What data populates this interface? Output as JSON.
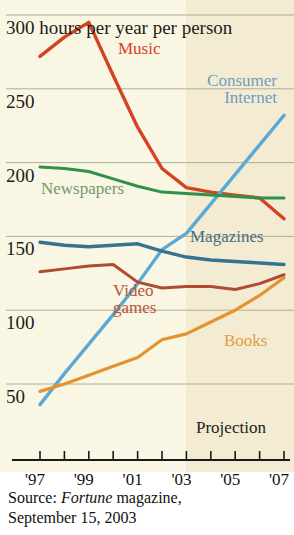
{
  "figure": {
    "background": "#faf6e4",
    "projection_band_color": "#f4ecd2",
    "axis_color": "#1c1c1c",
    "gridline_color": "#a9a78f"
  },
  "axis": {
    "y_top_label": "300 hours per year per person",
    "y_ticks": [
      {
        "value": 300,
        "label": "300 hours per year per person"
      },
      {
        "value": 250,
        "label": "250"
      },
      {
        "value": 200,
        "label": "200"
      },
      {
        "value": 150,
        "label": "150"
      },
      {
        "value": 100,
        "label": "100"
      },
      {
        "value": 50,
        "label": "50"
      }
    ],
    "x_tick_labels": [
      "'97",
      "'99",
      "'01",
      "'03",
      "'05",
      "'07"
    ],
    "x_tick_years": [
      1997,
      1998,
      1999,
      2000,
      2001,
      2002,
      2003,
      2004,
      2005,
      2006,
      2007
    ]
  },
  "annotations": {
    "projection": "Projection"
  },
  "source": {
    "prefix": "Source: ",
    "publication": "Fortune",
    "suffix": " magazine,",
    "date_line": "September 15, 2003"
  },
  "chart_data": {
    "type": "line",
    "title": "300 hours per year per person",
    "subtitle": "",
    "xlabel": "",
    "ylabel": "hours per year per person",
    "ylim": [
      25,
      300
    ],
    "xlim": [
      1997,
      2007
    ],
    "grid": true,
    "legend_position": "inline-labels",
    "x": [
      1997,
      1998,
      1999,
      2000,
      2001,
      2002,
      2003,
      2004,
      2005,
      2006,
      2007
    ],
    "projection_starts": 2003,
    "series": [
      {
        "name": "Music",
        "label": "Music",
        "color": "#d1441f",
        "label_color": "#d1441f",
        "values": [
          272,
          285,
          295,
          259,
          224,
          196,
          183,
          180,
          178,
          176,
          162
        ]
      },
      {
        "name": "Consumer Internet",
        "label": "Consumer\nInternet",
        "color": "#5ba9d4",
        "label_color": "#6b9ec4",
        "values": [
          36,
          57,
          77,
          97,
          118,
          141,
          152,
          172,
          192,
          212,
          232
        ]
      },
      {
        "name": "Newspapers",
        "label": "Newspapers",
        "color": "#2e9248",
        "label_color": "#6f9a6c",
        "values": [
          197,
          196,
          194,
          189,
          184,
          180,
          179,
          178,
          177,
          176,
          176
        ]
      },
      {
        "name": "Magazines",
        "label": "Magazines",
        "color": "#35748f",
        "label_color": "#4a6c80",
        "values": [
          146,
          144,
          143,
          144,
          145,
          140,
          136,
          134,
          133,
          132,
          131
        ]
      },
      {
        "name": "Video games",
        "label": "Video\ngames",
        "color": "#b04a30",
        "label_color": "#b5553c",
        "values": [
          126,
          128,
          130,
          131,
          119,
          115,
          116,
          116,
          114,
          118,
          124
        ]
      },
      {
        "name": "Books",
        "label": "Books",
        "color": "#e39330",
        "label_color": "#e0a040",
        "values": [
          45,
          50,
          56,
          62,
          68,
          80,
          84,
          92,
          100,
          110,
          122
        ]
      }
    ]
  }
}
